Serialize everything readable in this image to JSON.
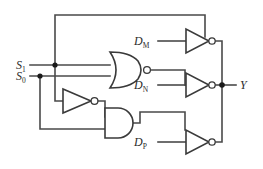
{
  "diagram": {
    "background_color": "#ffffff",
    "wire_color": "#4a4a4a",
    "gate_stroke_color": "#3a3a3a",
    "label_color": "#2b2b2b"
  },
  "inputs": [
    {
      "id": "s1",
      "base": "S",
      "subscript": "1",
      "x": 16,
      "y": 65
    },
    {
      "id": "s0",
      "base": "S",
      "subscript": "0",
      "x": 16,
      "y": 76
    },
    {
      "id": "dm",
      "base": "D",
      "subscript": "M",
      "x": 135,
      "y": 40
    },
    {
      "id": "dn",
      "base": "D",
      "subscript": "N",
      "x": 135,
      "y": 87
    },
    {
      "id": "dp",
      "base": "D",
      "subscript": "P",
      "x": 135,
      "y": 147
    }
  ],
  "outputs": [
    {
      "id": "y",
      "base": "Y",
      "subscript": "",
      "x": 240,
      "y": 85
    }
  ],
  "gates": [
    {
      "id": "nor-gate",
      "type": "NOR",
      "label": "NOR gate"
    },
    {
      "id": "not-gate",
      "type": "NOT",
      "label": "NOT gate (inverter)"
    },
    {
      "id": "and-gate",
      "type": "AND",
      "label": "AND gate"
    },
    {
      "id": "inverter-m",
      "type": "NOT",
      "label": "Inverter driving D sub M branch"
    },
    {
      "id": "inverter-n",
      "type": "NOT",
      "label": "Inverter driving D sub N branch"
    },
    {
      "id": "inverter-p",
      "type": "NOT",
      "label": "Inverter driving D sub P branch"
    }
  ],
  "junctions": [
    {
      "id": "s1-tap",
      "x": 55,
      "y": 65
    },
    {
      "id": "s0-tap",
      "x": 40,
      "y": 76
    },
    {
      "id": "y-node",
      "x": 222,
      "y": 85
    }
  ]
}
